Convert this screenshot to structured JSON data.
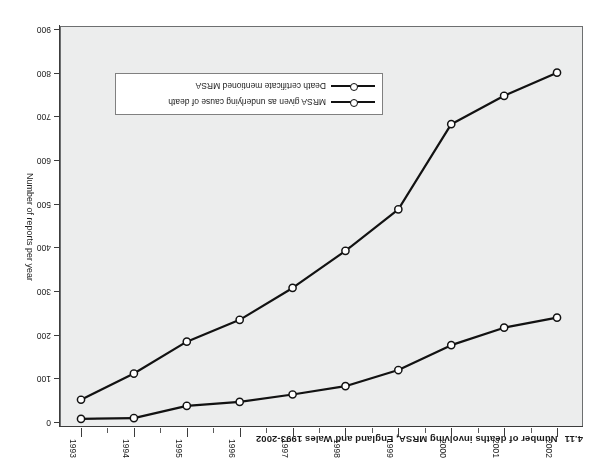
{
  "chart_data": {
    "type": "line",
    "title": "Number of deaths involving MRSA, England and Wales 1993-2002",
    "title_number": "4.11",
    "xlabel": "",
    "ylabel": "Number of reports per year",
    "categories": [
      "1993",
      "1994",
      "1995",
      "1996",
      "1997",
      "1998",
      "1999",
      "2000",
      "2001",
      "2002"
    ],
    "x": [
      1993,
      1994,
      1995,
      1996,
      1997,
      1998,
      1999,
      2000,
      2001,
      2002
    ],
    "ylim": [
      0,
      900
    ],
    "y_ticks": [
      0,
      100,
      200,
      300,
      400,
      500,
      600,
      700,
      800,
      900
    ],
    "y_tick_labels": [
      "0",
      "100",
      "200",
      "300",
      "400",
      "500",
      "600",
      "700",
      "800",
      "900"
    ],
    "y_inverted": true,
    "grid": false,
    "legend_position": "inside-lower-center",
    "rotated_180": true,
    "series": [
      {
        "name": "Death certificate mentioned MRSA",
        "values": [
          51,
          111,
          184,
          234,
          307,
          392,
          487,
          682,
          747,
          800
        ],
        "line_color": "#121212",
        "marker": "circle-open"
      },
      {
        "name": "MRSA given as underlying cause of death",
        "values": [
          7,
          9,
          37,
          46,
          63,
          82,
          119,
          176,
          216,
          239
        ],
        "line_color": "#121212",
        "marker": "circle-open"
      }
    ]
  },
  "legend": {
    "items": [
      {
        "label": "Death certificate mentioned MRSA"
      },
      {
        "label": "MRSA given as underlying cause of death"
      }
    ]
  },
  "colors": {
    "plot_background": "#eceded",
    "page_background": "#ffffff",
    "line": "#121212",
    "axis": "#3c3c3c",
    "text": "#1b1b1b"
  }
}
